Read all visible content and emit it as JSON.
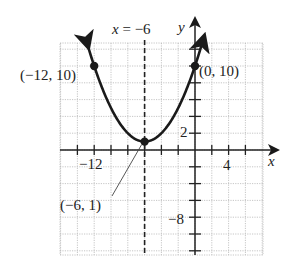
{
  "chart_data": {
    "type": "line",
    "title": "",
    "function": "y = (1/4)(x + 6)^2 + 1",
    "xlabel": "x",
    "ylabel": "y",
    "xlim": [
      -16,
      8
    ],
    "ylim": [
      -12,
      12
    ],
    "grid": true,
    "grid_step": 2,
    "series": [
      {
        "name": "parabola",
        "x": [
          -13,
          -12,
          -10,
          -8,
          -6,
          -4,
          -2,
          0,
          1
        ],
        "y": [
          13.25,
          10,
          5,
          2,
          1,
          2,
          5,
          10,
          13.25
        ]
      }
    ],
    "axis_of_symmetry": {
      "label": "x = −6",
      "x": -6,
      "style": "dashed"
    },
    "tick_labels": {
      "x": [
        {
          "value": -12,
          "label": "−12"
        },
        {
          "value": 4,
          "label": "4"
        }
      ],
      "y": [
        {
          "value": 2,
          "label": "2"
        },
        {
          "value": -8,
          "label": "−8"
        }
      ]
    },
    "points": [
      {
        "x": -12,
        "y": 10,
        "label": "(−12, 10)"
      },
      {
        "x": 0,
        "y": 10,
        "label": "(0, 10)"
      },
      {
        "x": -6,
        "y": 1,
        "label": "(−6, 1)",
        "callout": true
      }
    ]
  },
  "labels": {
    "axis_sym": "x = −6",
    "x_axis": "x",
    "y_axis": "y",
    "tick_x_neg12": "−12",
    "tick_x_4": "4",
    "tick_y_2": "2",
    "tick_y_neg8": "−8",
    "pt_left": "(−12, 10)",
    "pt_right": "(0, 10)",
    "pt_vertex": "(−6, 1)"
  },
  "colors": {
    "curve": "#1a1a1a",
    "grid": "#b8b8b8",
    "axis": "#222222"
  }
}
